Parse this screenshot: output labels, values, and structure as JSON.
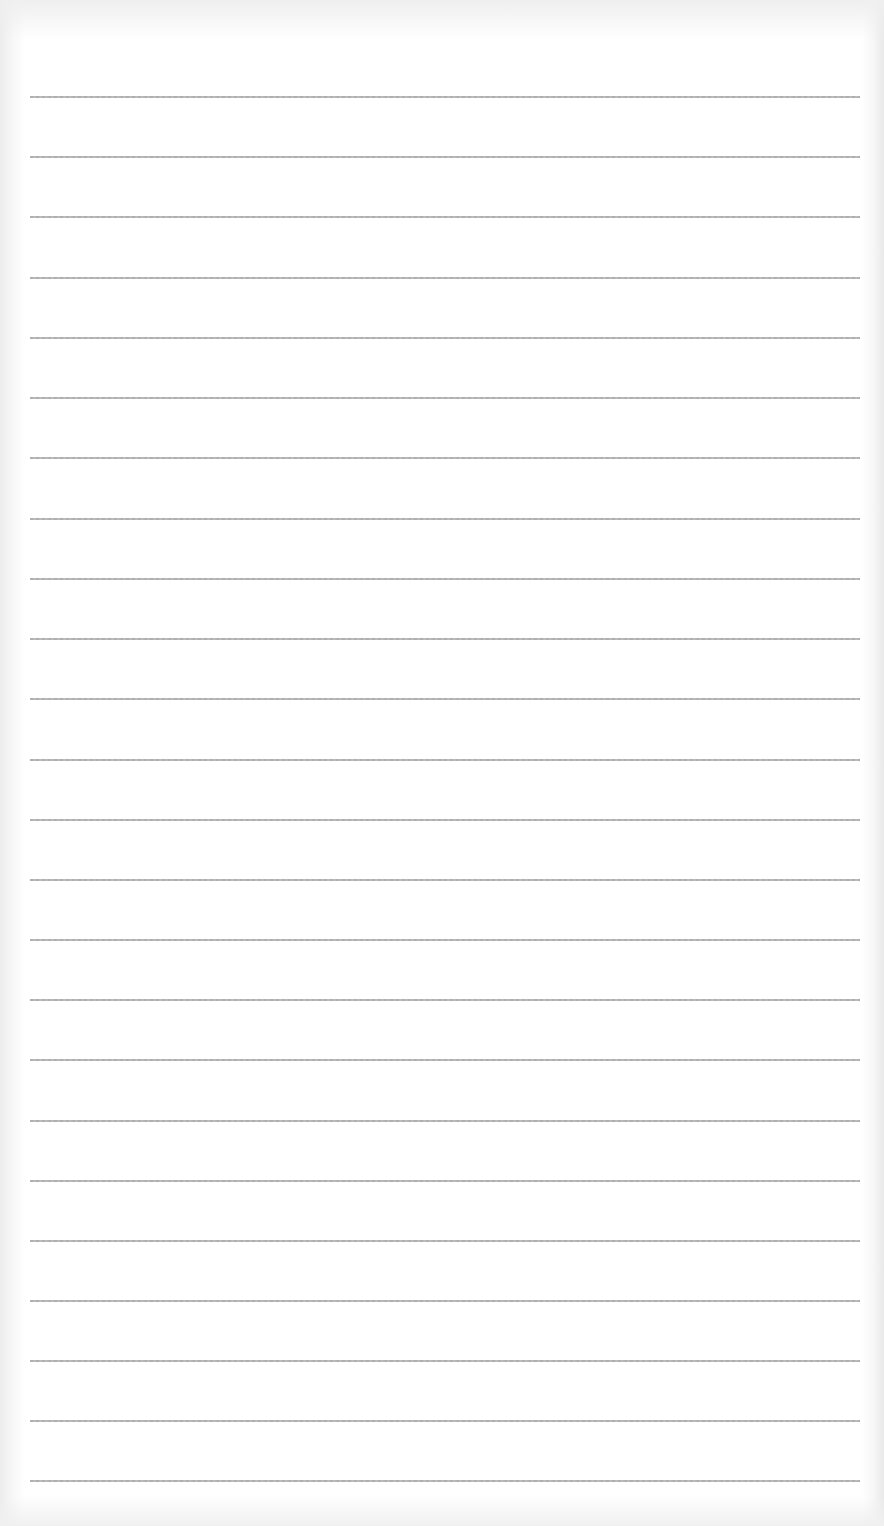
{
  "page": {
    "type": "blank-ruled-sheet",
    "line_count": 24,
    "line_color": "#a6a6a6",
    "background_color": "#ffffff",
    "lines": [
      {
        "y": 96
      },
      {
        "y": 156
      },
      {
        "y": 216
      },
      {
        "y": 277
      },
      {
        "y": 337
      },
      {
        "y": 397
      },
      {
        "y": 457
      },
      {
        "y": 518
      },
      {
        "y": 578
      },
      {
        "y": 638
      },
      {
        "y": 698
      },
      {
        "y": 759
      },
      {
        "y": 819
      },
      {
        "y": 879
      },
      {
        "y": 939
      },
      {
        "y": 999
      },
      {
        "y": 1059
      },
      {
        "y": 1120
      },
      {
        "y": 1180
      },
      {
        "y": 1240
      },
      {
        "y": 1300
      },
      {
        "y": 1360
      },
      {
        "y": 1420
      },
      {
        "y": 1480
      }
    ]
  }
}
